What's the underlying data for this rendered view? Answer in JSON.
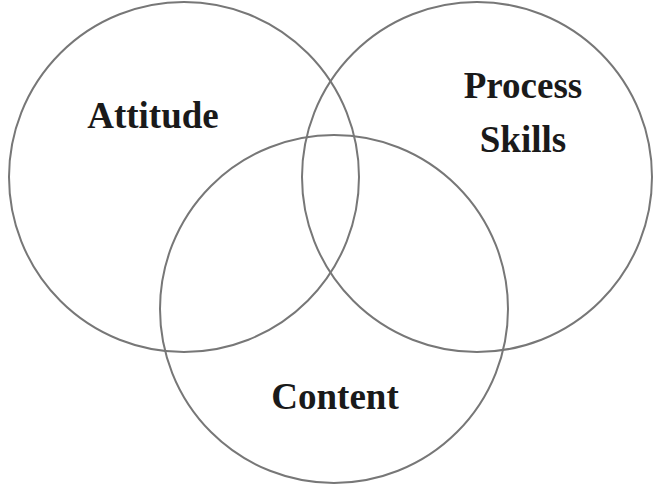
{
  "diagram": {
    "type": "venn",
    "stroke_color": "#777777",
    "text_color": "#1a1a1a",
    "background": "#ffffff",
    "sets": [
      {
        "id": "attitude",
        "label_lines": [
          "Attitude"
        ],
        "circle": {
          "cx": 184,
          "cy": 177,
          "r": 175
        }
      },
      {
        "id": "process-skills",
        "label_lines": [
          "Process",
          "Skills"
        ],
        "circle": {
          "cx": 477,
          "cy": 177,
          "r": 175
        }
      },
      {
        "id": "content",
        "label_lines": [
          "Content"
        ],
        "circle": {
          "cx": 334,
          "cy": 309,
          "r": 174
        }
      }
    ]
  }
}
